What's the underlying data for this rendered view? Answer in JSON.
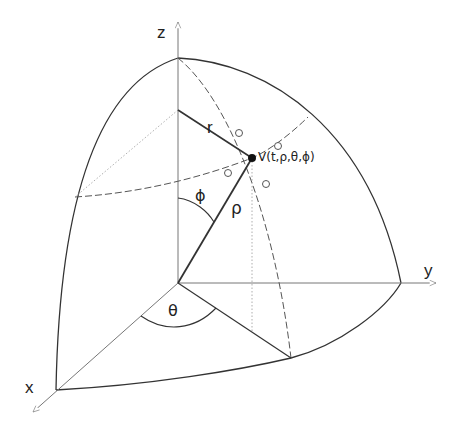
{
  "labels": {
    "x_axis": "x",
    "y_axis": "y",
    "z_axis": "z",
    "r": "r",
    "rho": "ρ",
    "phi": "ϕ",
    "theta": "θ",
    "point": "V(t,ρ,θ,ϕ)"
  },
  "colors": {
    "background": "#ffffff",
    "stroke": "#333333",
    "axis": "#777777",
    "dotted": "#888888",
    "point": "#111111"
  },
  "geometry": {
    "origin": [
      178,
      283
    ],
    "z_top": [
      178,
      58
    ],
    "y_sphere": [
      401,
      283
    ],
    "x_sphere": [
      56,
      390
    ],
    "point_V": [
      252,
      158
    ]
  }
}
